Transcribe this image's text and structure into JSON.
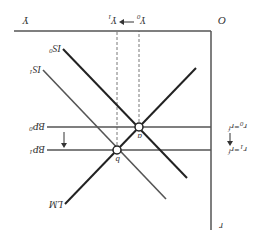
{
  "diagram": {
    "orientation": "rotated-180",
    "origin_label": "O",
    "x_axis_label": "Y",
    "y_axis_label": "r",
    "income_shift": {
      "from": "Y",
      "from_sub": "0",
      "to": "Y",
      "to_sub": "1"
    },
    "rate_labels": {
      "r0": {
        "main": "r",
        "sub": "0",
        "eq": "=r",
        "eq_sup": "f"
      },
      "r1": {
        "main": "r",
        "sub": "1",
        "eq": "=r",
        "eq_sup": "f"
      }
    },
    "curves": {
      "IS0": {
        "main": "IS",
        "sub": "0"
      },
      "IS1": {
        "main": "IS",
        "sub": "1"
      },
      "LM": {
        "main": "LM"
      },
      "BP0": {
        "main": "BP",
        "sub": "0"
      },
      "BP1": {
        "main": "BP",
        "sub": "1"
      }
    },
    "points": {
      "a": "a",
      "b": "b"
    },
    "colors": {
      "axis": "#555555",
      "is0": "#222222",
      "is1": "#555555",
      "lm": "#222222",
      "bp": "#555555"
    }
  }
}
